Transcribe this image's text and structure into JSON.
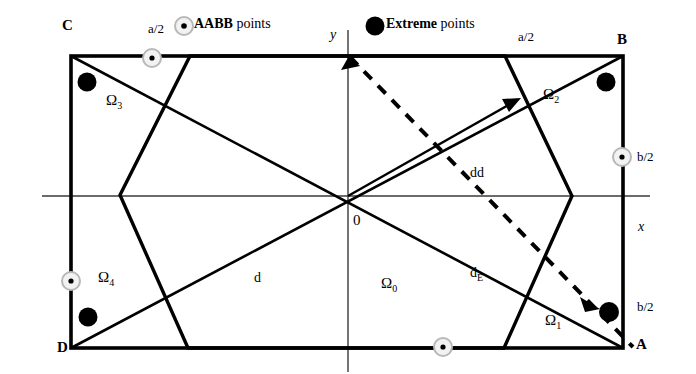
{
  "figure": {
    "legend": {
      "aabb_marker_name": "aabb-point-marker",
      "aabb_label_bold": "AABB",
      "aabb_label_rest": " points",
      "extreme_marker_name": "extreme-point-marker",
      "extreme_label_bold": "Extreme",
      "extreme_label_rest": " points"
    },
    "corners": {
      "top_left": "C",
      "top_right": "B",
      "bottom_left": "D",
      "bottom_right": "A"
    },
    "axes": {
      "y_label": "y",
      "x_label": "x",
      "origin_label": "0"
    },
    "dimensions": [
      {
        "label": "a/2",
        "position": "top-left-edge"
      },
      {
        "label": "a/2",
        "position": "top-right-edge"
      },
      {
        "label": "b/2",
        "position": "right-upper-edge"
      },
      {
        "label": "b/2",
        "position": "right-lower-edge"
      }
    ],
    "regions": [
      {
        "label": "Ω",
        "sub": "0"
      },
      {
        "label": "Ω",
        "sub": "1"
      },
      {
        "label": "Ω",
        "sub": "2"
      },
      {
        "label": "Ω",
        "sub": "3"
      },
      {
        "label": "Ω",
        "sub": "4"
      }
    ],
    "distance_labels": [
      {
        "label": "d",
        "sub": ""
      },
      {
        "label": "d",
        "sub": "E"
      },
      {
        "label": "dd",
        "sub": ""
      }
    ],
    "colors": {
      "stroke": "#000000",
      "background": "#ffffff",
      "axis": "#333333",
      "extreme_fill": "#000000",
      "aabb_fill": "#ffffff"
    }
  }
}
